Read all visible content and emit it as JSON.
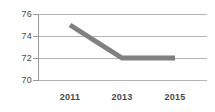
{
  "chart_data": {
    "type": "line",
    "title": "",
    "subtitle": "",
    "xlabel": "",
    "ylabel": "",
    "x": [
      2011,
      2013,
      2015
    ],
    "categories": [
      "2011",
      "2013",
      "2015"
    ],
    "series": [
      {
        "name": "",
        "values": [
          75,
          72,
          72
        ],
        "color": "#808080"
      }
    ],
    "ylim": [
      70,
      76
    ],
    "yticks": [
      70,
      72,
      74,
      76
    ],
    "ytick_labels": [
      "70",
      "72",
      "74",
      "76"
    ],
    "xtick_labels": [
      "2011",
      "2013",
      "2015"
    ],
    "grid": true,
    "grid_axis": "y",
    "legend": false,
    "legend_position": "none",
    "markers": false,
    "line_width_px": 5,
    "colors": {
      "series_line": "#808080",
      "gridline": "#b3b3b3",
      "axis": "#9a9a9a",
      "tick_label": "#4a4a4a",
      "background": "#ffffff"
    }
  },
  "axis": {
    "y": {
      "ticks": [
        {
          "label": "76"
        },
        {
          "label": "74"
        },
        {
          "label": "72"
        },
        {
          "label": "70"
        }
      ]
    },
    "x": {
      "ticks": [
        {
          "label": "2011"
        },
        {
          "label": "2013"
        },
        {
          "label": "2015"
        }
      ]
    }
  }
}
